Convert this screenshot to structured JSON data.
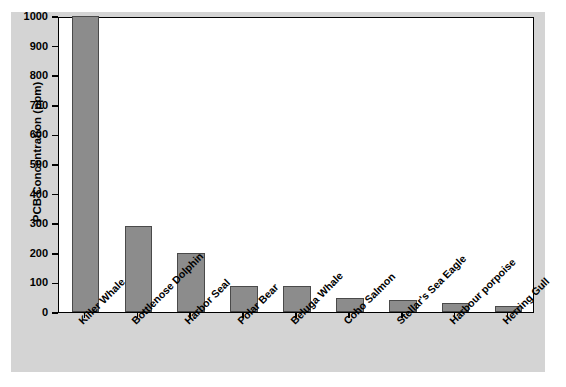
{
  "chart_data": {
    "type": "bar",
    "title": "",
    "xlabel": "",
    "ylabel": "PCB Concentration (ppm)",
    "ylim": [
      0,
      1000
    ],
    "yticks": [
      0,
      100,
      200,
      300,
      400,
      500,
      600,
      700,
      800,
      900,
      1000
    ],
    "grid": false,
    "legend": null,
    "bar_color": "#8c8c8c",
    "bar_edge_color": "#4a4a4a",
    "panel_color": "#d4d4d4",
    "plot_bg_color": "#ffffff",
    "categories": [
      "Killer Whale",
      "Bottlenose Dolphin",
      "Harbor Seal",
      "Polar Bear",
      "Beluga Whale",
      "Coho Salmon",
      "Stellar's Sea Eagle",
      "Harbour porpoise",
      "Herring Gull"
    ],
    "values": [
      1000,
      290,
      200,
      88,
      88,
      47,
      42,
      32,
      20
    ]
  }
}
